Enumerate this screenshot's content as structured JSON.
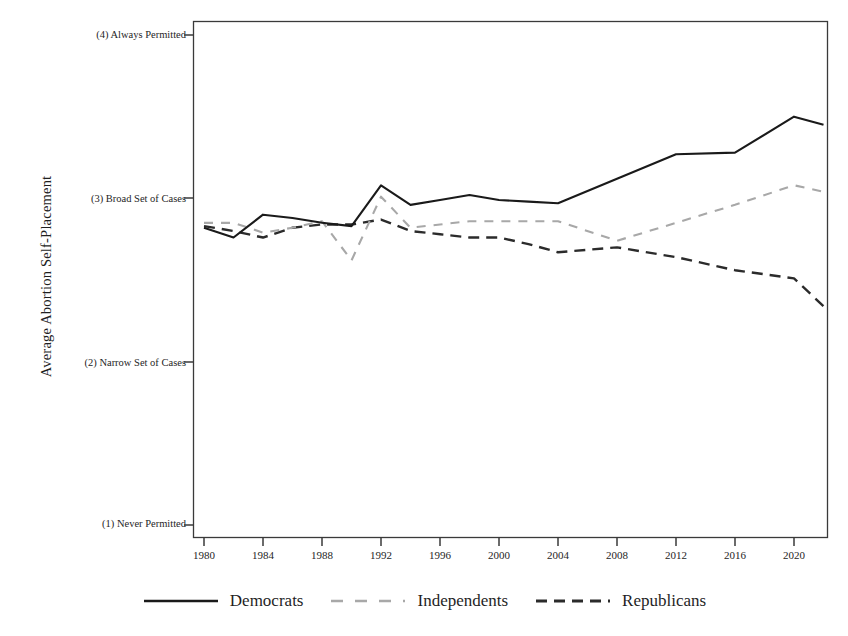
{
  "figure": {
    "ylabel": "Average Abortion Self-Placement",
    "xlabel": ""
  },
  "legend": {
    "position": "bottom-center",
    "items": [
      {
        "label": "Democrats",
        "style": "solid",
        "color": "#1a1a1a",
        "swatch": "legend-line-solid"
      },
      {
        "label": "Independents",
        "style": "dashed-light",
        "color": "#a8a8a8",
        "swatch": "legend-line-dashed-light"
      },
      {
        "label": "Republicans",
        "style": "dashed-dark",
        "color": "#2b2b2b",
        "swatch": "legend-line-dashed-dark"
      }
    ]
  },
  "axes": {
    "y_tick_labels": [
      "(4) Always Permitted",
      "(3) Broad Set of Cases",
      "(2) Narrow Set of Cases",
      "(1) Never Permitted"
    ],
    "y_tick_values": [
      4,
      3,
      2,
      1
    ],
    "x_tick_labels": [
      "1980",
      "1984",
      "1988",
      "1992",
      "1996",
      "2000",
      "2004",
      "2008",
      "2012",
      "2016",
      "2020"
    ],
    "x_tick_values": [
      1980,
      1984,
      1988,
      1992,
      1996,
      2000,
      2004,
      2008,
      2012,
      2016,
      2020
    ]
  },
  "chart_data": {
    "type": "line",
    "title": "",
    "xlabel": "",
    "ylabel": "Average Abortion Self-Placement",
    "xlim": [
      1979,
      2023
    ],
    "ylim": [
      1,
      4
    ],
    "grid": false,
    "legend_position": "bottom-center",
    "y_category_labels": {
      "1": "(1) Never Permitted",
      "2": "(2) Narrow Set of Cases",
      "3": "(3) Broad Set of Cases",
      "4": "(4) Always Permitted"
    },
    "x": [
      1980,
      1982,
      1984,
      1986,
      1988,
      1990,
      1992,
      1994,
      1996,
      1998,
      2000,
      2002,
      2004,
      2008,
      2012,
      2016,
      2020,
      2022
    ],
    "series": [
      {
        "name": "Democrats",
        "color": "#1a1a1a",
        "style": "solid",
        "values": [
          2.82,
          2.76,
          2.9,
          2.88,
          2.85,
          2.83,
          3.08,
          2.96,
          2.99,
          3.02,
          2.99,
          2.98,
          2.97,
          3.12,
          3.27,
          3.28,
          3.5,
          3.45
        ]
      },
      {
        "name": "Independents",
        "color": "#a8a8a8",
        "style": "dashed",
        "values": [
          2.85,
          2.85,
          2.79,
          2.82,
          2.86,
          2.62,
          3.01,
          2.82,
          2.84,
          2.86,
          2.86,
          2.86,
          2.86,
          2.74,
          2.85,
          2.96,
          3.08,
          3.04
        ]
      },
      {
        "name": "Republicans",
        "color": "#2b2b2b",
        "style": "dashed",
        "values": [
          2.83,
          2.8,
          2.76,
          2.82,
          2.84,
          2.84,
          2.87,
          2.8,
          2.78,
          2.76,
          2.76,
          2.72,
          2.67,
          2.7,
          2.64,
          2.56,
          2.51,
          2.34
        ]
      }
    ]
  }
}
